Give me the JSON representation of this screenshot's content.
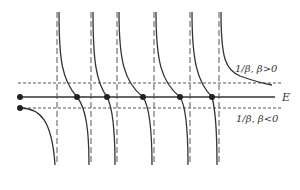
{
  "diagram": {
    "labels": {
      "upper": "1/β, β>0",
      "energy_axis": "E",
      "lower": "1/β, β<0"
    },
    "colors": {
      "line": "#333333",
      "dashed": "#555555",
      "background": "#ffffff"
    },
    "asymptotes_x": [
      57,
      91,
      117,
      154,
      190,
      219
    ],
    "horizontal_lines_y": {
      "upper_dashed": 83,
      "energy_axis": 97,
      "lower_dashed": 108
    },
    "intersection_points_on_E": [
      20,
      77,
      107,
      143,
      180,
      212
    ],
    "lower_start_point": [
      20,
      108
    ]
  }
}
